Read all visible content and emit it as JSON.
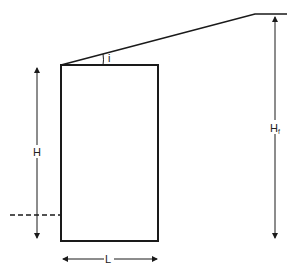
{
  "diagram": {
    "type": "retaining-wall-geometry",
    "labels": {
      "wall_height": "H",
      "total_height": "H",
      "total_height_subscript": "f",
      "base_width": "L",
      "slope_angle": "i"
    },
    "colors": {
      "line": "#1a1a1a",
      "background": "#ffffff"
    }
  }
}
